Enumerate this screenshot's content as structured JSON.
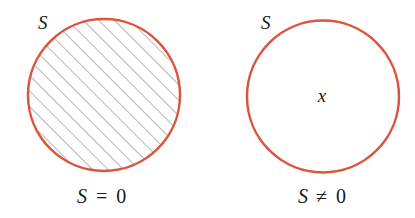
{
  "colors": {
    "circle_stroke": "#d9553f",
    "hatch": "#6e6e6e",
    "text": "#1a1a1a",
    "background": "#ffffff"
  },
  "panels": [
    {
      "set_label": "S",
      "caption_lhs": "S",
      "caption_op": "=",
      "caption_rhs": "0",
      "filled": true,
      "interior_label": ""
    },
    {
      "set_label": "S",
      "caption_lhs": "S",
      "caption_op": "≠",
      "caption_rhs": "0",
      "filled": false,
      "interior_label": "x"
    }
  ]
}
